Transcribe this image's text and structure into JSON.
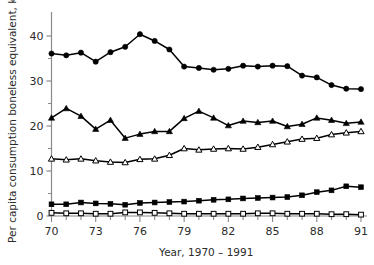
{
  "chart_data": {
    "type": "line",
    "title": "",
    "subtitle": "",
    "xlabel": "Year, 1970 – 1991",
    "ylabel": "Per capita consumption boneless equivalent, kg",
    "xlim": [
      1970,
      1991
    ],
    "ylim": [
      0,
      44
    ],
    "grid": false,
    "legend": "none",
    "x": [
      1970,
      1971,
      1972,
      1973,
      1974,
      1975,
      1976,
      1977,
      1978,
      1979,
      1980,
      1981,
      1982,
      1983,
      1984,
      1985,
      1986,
      1987,
      1988,
      1989,
      1990,
      1991
    ],
    "xticks": [
      1970,
      1973,
      1976,
      1979,
      1982,
      1985,
      1988,
      1991
    ],
    "xtick_labels": [
      "70",
      "73",
      "76",
      "79",
      "82",
      "85",
      "88",
      "91"
    ],
    "yticks": [
      0,
      10,
      20,
      30,
      40
    ],
    "ytick_labels": [
      "0",
      "10",
      "20",
      "30",
      "40"
    ],
    "yminor_ticks": [
      5,
      15,
      25,
      35
    ],
    "series": [
      {
        "name": "series-filled-circle",
        "marker": "filled-circle",
        "color": "#000000",
        "values": [
          36.1,
          35.7,
          36.3,
          34.3,
          36.4,
          37.6,
          40.4,
          38.9,
          37.0,
          33.2,
          32.9,
          32.5,
          32.7,
          33.4,
          33.2,
          33.4,
          33.3,
          31.2,
          30.8,
          29.1,
          28.3,
          28.2
        ]
      },
      {
        "name": "series-filled-triangle",
        "marker": "filled-triangle",
        "color": "#000000",
        "values": [
          21.8,
          23.9,
          22.2,
          19.3,
          21.3,
          17.3,
          18.2,
          18.8,
          18.8,
          21.7,
          23.3,
          21.8,
          20.1,
          21.1,
          20.8,
          21.1,
          19.9,
          20.4,
          21.8,
          21.3,
          20.6,
          20.9
        ]
      },
      {
        "name": "series-open-triangle",
        "marker": "open-triangle",
        "color": "#000000",
        "values": [
          12.7,
          12.5,
          12.7,
          12.3,
          12.0,
          11.9,
          12.6,
          12.7,
          13.5,
          15.0,
          14.7,
          14.9,
          15.0,
          14.9,
          15.3,
          15.9,
          16.5,
          17.1,
          17.3,
          18.1,
          18.5,
          18.8
        ]
      },
      {
        "name": "series-filled-square",
        "marker": "filled-square",
        "color": "#000000",
        "values": [
          2.6,
          2.6,
          3.0,
          2.8,
          2.7,
          2.5,
          2.9,
          3.0,
          3.1,
          3.2,
          3.4,
          3.6,
          3.7,
          3.9,
          4.0,
          4.1,
          4.2,
          4.6,
          5.3,
          5.7,
          6.6,
          6.4
        ]
      },
      {
        "name": "series-open-square",
        "marker": "open-square",
        "color": "#000000",
        "values": [
          0.7,
          0.6,
          0.6,
          0.5,
          0.5,
          0.8,
          0.8,
          0.7,
          0.6,
          0.5,
          0.5,
          0.5,
          0.5,
          0.5,
          0.6,
          0.6,
          0.5,
          0.5,
          0.5,
          0.4,
          0.4,
          0.3
        ]
      }
    ]
  },
  "axes": {
    "y_title": "Per capita consumption boneless equivalent, kg",
    "x_title": "Year, 1970 – 1991"
  }
}
